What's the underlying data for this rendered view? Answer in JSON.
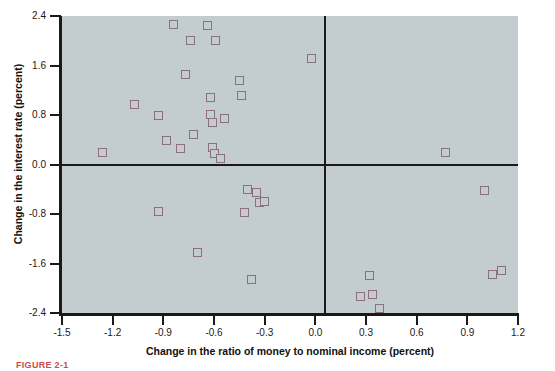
{
  "chart_data": {
    "type": "scatter",
    "title": "",
    "xlabel": "Change in the ratio of money to nominal income (percent)",
    "ylabel": "Change in the interest rate (percent)",
    "xlim": [
      -1.5,
      1.2
    ],
    "ylim": [
      -2.4,
      2.4
    ],
    "xticks": [
      "-1.5",
      "-1.2",
      "-0.9",
      "-0.6",
      "-0.3",
      "0.0",
      "0.3",
      "0.6",
      "0.9",
      "1.2"
    ],
    "xtick_values": [
      -1.5,
      -1.2,
      -0.9,
      -0.6,
      -0.3,
      0.0,
      0.3,
      0.6,
      0.9,
      1.2
    ],
    "yticks": [
      "2.4",
      "1.6",
      "0.8",
      "0.0",
      "-0.8",
      "-1.6",
      "-2.4"
    ],
    "ytick_values": [
      2.4,
      1.6,
      0.8,
      0.0,
      -0.8,
      -1.6,
      -2.4
    ],
    "grid": false,
    "legend": false,
    "reference_lines": {
      "horizontal": 0.0,
      "vertical": 0.0
    },
    "marker": {
      "shape": "square-open",
      "edge_color": "#8a6f80",
      "fill": "none",
      "size_px": 9
    },
    "plot_background": "#c3ccce",
    "points": [
      {
        "x": -1.26,
        "y": 0.19
      },
      {
        "x": -1.07,
        "y": 0.97
      },
      {
        "x": -0.93,
        "y": 0.79
      },
      {
        "x": -0.93,
        "y": -0.76
      },
      {
        "x": -0.88,
        "y": 0.38
      },
      {
        "x": -0.84,
        "y": 2.26
      },
      {
        "x": -0.8,
        "y": 0.26
      },
      {
        "x": -0.77,
        "y": 1.45
      },
      {
        "x": -0.74,
        "y": 2.0
      },
      {
        "x": -0.72,
        "y": 0.49
      },
      {
        "x": -0.7,
        "y": -1.43
      },
      {
        "x": -0.64,
        "y": 2.25
      },
      {
        "x": -0.62,
        "y": 1.09
      },
      {
        "x": -0.62,
        "y": 0.81
      },
      {
        "x": -0.61,
        "y": 0.68
      },
      {
        "x": -0.61,
        "y": 0.27
      },
      {
        "x": -0.6,
        "y": 0.18
      },
      {
        "x": -0.59,
        "y": 2.0
      },
      {
        "x": -0.56,
        "y": 0.09
      },
      {
        "x": -0.54,
        "y": 0.74
      },
      {
        "x": -0.45,
        "y": 1.35
      },
      {
        "x": -0.44,
        "y": 1.12
      },
      {
        "x": -0.42,
        "y": -0.78
      },
      {
        "x": -0.4,
        "y": -0.41
      },
      {
        "x": -0.38,
        "y": -1.86
      },
      {
        "x": -0.35,
        "y": -0.46
      },
      {
        "x": -0.33,
        "y": -0.62
      },
      {
        "x": -0.3,
        "y": -0.59
      },
      {
        "x": -0.02,
        "y": 1.72
      },
      {
        "x": 0.27,
        "y": -2.14
      },
      {
        "x": 0.32,
        "y": -1.8
      },
      {
        "x": 0.34,
        "y": -2.1
      },
      {
        "x": 0.38,
        "y": -2.32
      },
      {
        "x": 0.77,
        "y": 0.2
      },
      {
        "x": 1.0,
        "y": -0.42
      },
      {
        "x": 1.05,
        "y": -1.78
      },
      {
        "x": 1.1,
        "y": -1.72
      }
    ]
  },
  "caption": {
    "text": "FIGURE 2-1"
  }
}
